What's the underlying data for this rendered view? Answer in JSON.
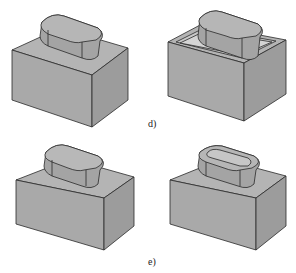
{
  "figure": {
    "colors": {
      "face_front": "#a9a9a9",
      "face_side": "#9c9c9c",
      "face_top": "#b4b4b4",
      "boss": "#a4a4a4",
      "boss_top": "#b6b6b6",
      "edge": "#2a2a2a"
    },
    "panels": [
      {
        "id": "d-left",
        "description": "Rectangular block with obround boss on top"
      },
      {
        "id": "d-right",
        "description": "Rectangular block shelled with obround boss inside pocket"
      },
      {
        "id": "e-left",
        "description": "Rectangular block with filleted obround boss"
      },
      {
        "id": "e-right",
        "description": "Rectangular block with obround boss having recessed groove"
      }
    ],
    "labels": {
      "d": "d)",
      "e": "e)"
    }
  }
}
